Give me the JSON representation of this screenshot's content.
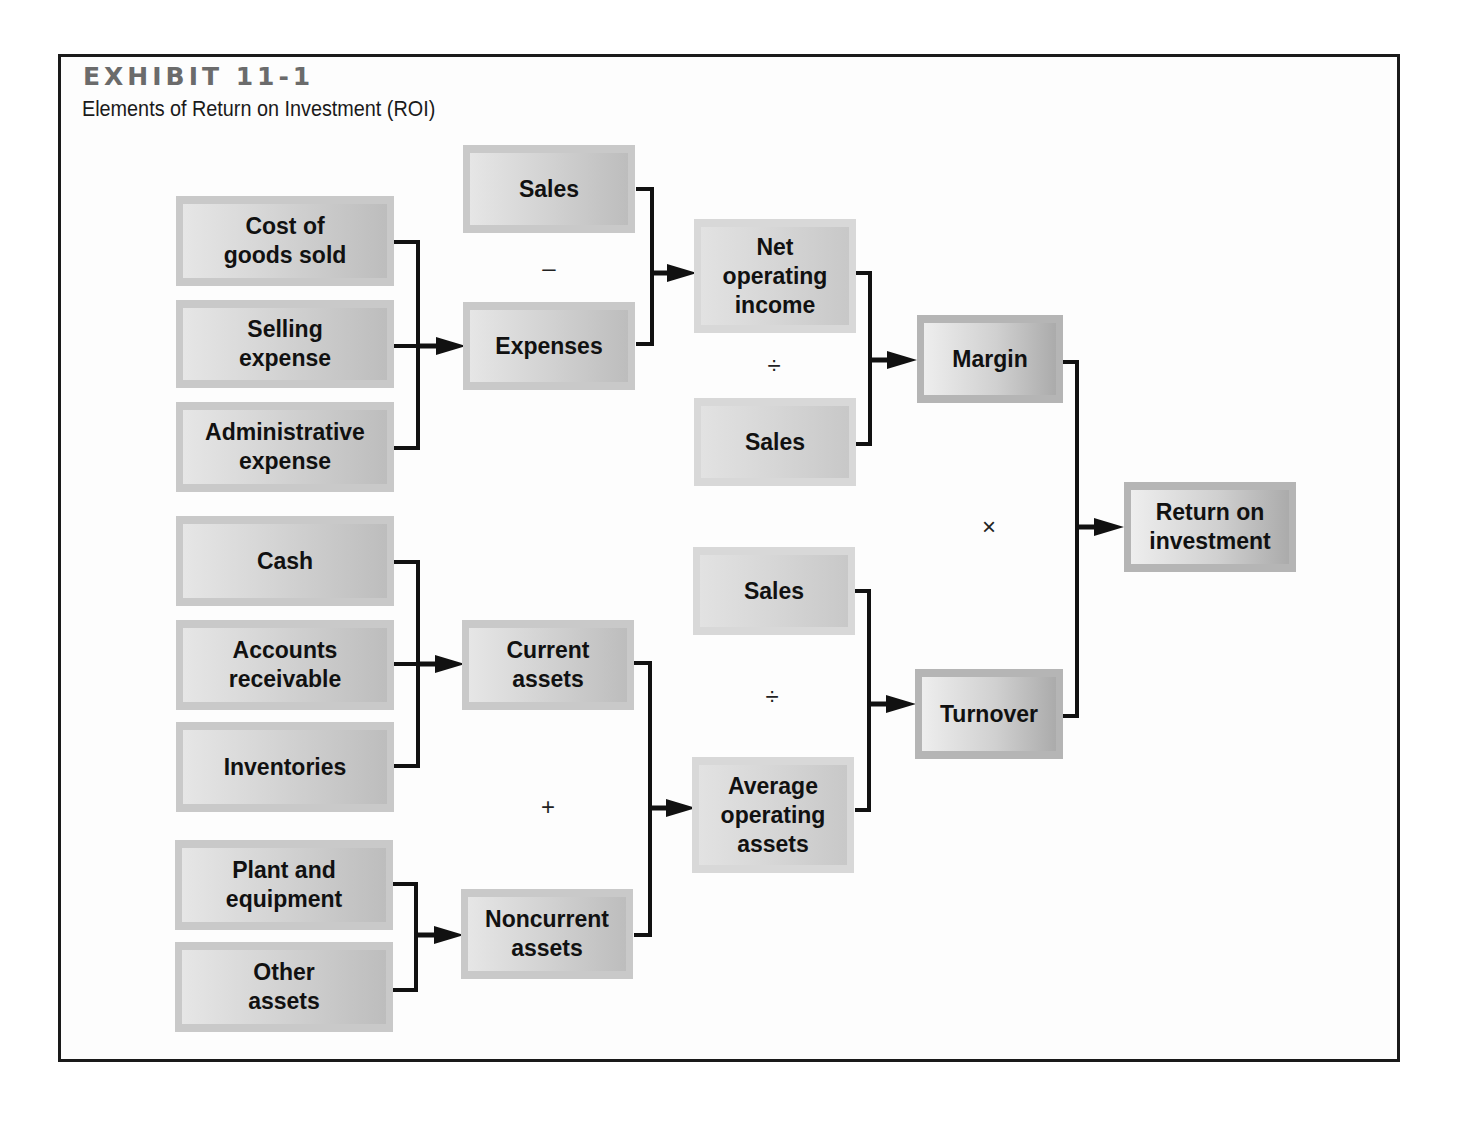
{
  "header": {
    "exhibit_label": "EXHIBIT 11-1",
    "title": "Elements of Return on Investment (ROI)"
  },
  "colors": {
    "frame": "#1a1a1a",
    "box_outer": "#c9c9c9",
    "box_inner_light": "#e6e6e6",
    "box_inner_dark": "#bdbdbd",
    "connector": "#111111"
  },
  "nodes": [
    {
      "id": "cost-of-goods-sold",
      "label": "Cost of\ngoods sold",
      "x": 176,
      "y": 196,
      "w": 218,
      "h": 90,
      "style": ""
    },
    {
      "id": "selling-expense",
      "label": "Selling\nexpense",
      "x": 176,
      "y": 300,
      "w": 218,
      "h": 88,
      "style": ""
    },
    {
      "id": "administrative-expense",
      "label": "Administrative\nexpense",
      "x": 176,
      "y": 402,
      "w": 218,
      "h": 90,
      "style": ""
    },
    {
      "id": "sales-1",
      "label": "Sales",
      "x": 463,
      "y": 145,
      "w": 172,
      "h": 88,
      "style": ""
    },
    {
      "id": "expenses",
      "label": "Expenses",
      "x": 463,
      "y": 302,
      "w": 172,
      "h": 88,
      "style": ""
    },
    {
      "id": "net-operating-income",
      "label": "Net\noperating\nincome",
      "x": 694,
      "y": 219,
      "w": 162,
      "h": 114,
      "style": "light"
    },
    {
      "id": "sales-2",
      "label": "Sales",
      "x": 694,
      "y": 398,
      "w": 162,
      "h": 88,
      "style": "light"
    },
    {
      "id": "margin",
      "label": "Margin",
      "x": 917,
      "y": 315,
      "w": 146,
      "h": 88,
      "style": "dark"
    },
    {
      "id": "return-on-investment",
      "label": "Return on\ninvestment",
      "x": 1124,
      "y": 482,
      "w": 172,
      "h": 90,
      "style": "dark"
    },
    {
      "id": "cash",
      "label": "Cash",
      "x": 176,
      "y": 516,
      "w": 218,
      "h": 90,
      "style": ""
    },
    {
      "id": "accounts-receivable",
      "label": "Accounts\nreceivable",
      "x": 176,
      "y": 620,
      "w": 218,
      "h": 90,
      "style": ""
    },
    {
      "id": "inventories",
      "label": "Inventories",
      "x": 176,
      "y": 722,
      "w": 218,
      "h": 90,
      "style": ""
    },
    {
      "id": "current-assets",
      "label": "Current\nassets",
      "x": 462,
      "y": 620,
      "w": 172,
      "h": 90,
      "style": ""
    },
    {
      "id": "sales-3",
      "label": "Sales",
      "x": 693,
      "y": 547,
      "w": 162,
      "h": 88,
      "style": "light"
    },
    {
      "id": "turnover",
      "label": "Turnover",
      "x": 915,
      "y": 669,
      "w": 148,
      "h": 90,
      "style": "dark"
    },
    {
      "id": "average-operating-assets",
      "label": "Average\noperating\nassets",
      "x": 692,
      "y": 757,
      "w": 162,
      "h": 116,
      "style": "light"
    },
    {
      "id": "plant-and-equipment",
      "label": "Plant and\nequipment",
      "x": 175,
      "y": 840,
      "w": 218,
      "h": 90,
      "style": ""
    },
    {
      "id": "other-assets",
      "label": "Other\nassets",
      "x": 175,
      "y": 942,
      "w": 218,
      "h": 90,
      "style": ""
    },
    {
      "id": "noncurrent-assets",
      "label": "Noncurrent\nassets",
      "x": 461,
      "y": 889,
      "w": 172,
      "h": 90,
      "style": ""
    }
  ],
  "operators": [
    {
      "id": "minus",
      "symbol": "–",
      "x": 549,
      "y": 268
    },
    {
      "id": "divide-margin",
      "symbol": "÷",
      "x": 774,
      "y": 366
    },
    {
      "id": "multiply",
      "symbol": "×",
      "x": 989,
      "y": 527
    },
    {
      "id": "divide-turnover",
      "symbol": "÷",
      "x": 772,
      "y": 697
    },
    {
      "id": "plus",
      "symbol": "+",
      "x": 548,
      "y": 807
    }
  ],
  "connectors": [
    {
      "id": "expenses-bracket",
      "bx": 418,
      "ys": [
        242,
        346,
        448
      ],
      "sx": 394,
      "ay": 346,
      "ax": 466
    },
    {
      "id": "noi-bracket",
      "bx": 652,
      "ys": [
        189,
        344
      ],
      "sx": 636,
      "ay": 273,
      "ax": 697
    },
    {
      "id": "margin-bracket",
      "bx": 870,
      "ys": [
        273,
        444
      ],
      "sx": 856,
      "ay": 360,
      "ax": 917
    },
    {
      "id": "roi-bracket",
      "bx": 1077,
      "ys": [
        362,
        716
      ],
      "sx": 1062,
      "ay": 527,
      "ax": 1124
    },
    {
      "id": "current-assets-bracket",
      "bx": 418,
      "ys": [
        562,
        664,
        766
      ],
      "sx": 394,
      "ay": 664,
      "ax": 465
    },
    {
      "id": "noncurrent-bracket",
      "bx": 416,
      "ys": [
        884,
        990
      ],
      "sx": 393,
      "ay": 935,
      "ax": 464
    },
    {
      "id": "avg-assets-bracket",
      "bx": 650,
      "ys": [
        663,
        935
      ],
      "sx": 634,
      "ay": 808,
      "ax": 696
    },
    {
      "id": "turnover-bracket",
      "bx": 869,
      "ys": [
        591,
        810
      ],
      "sx": 855,
      "ay": 704,
      "ax": 916
    }
  ]
}
